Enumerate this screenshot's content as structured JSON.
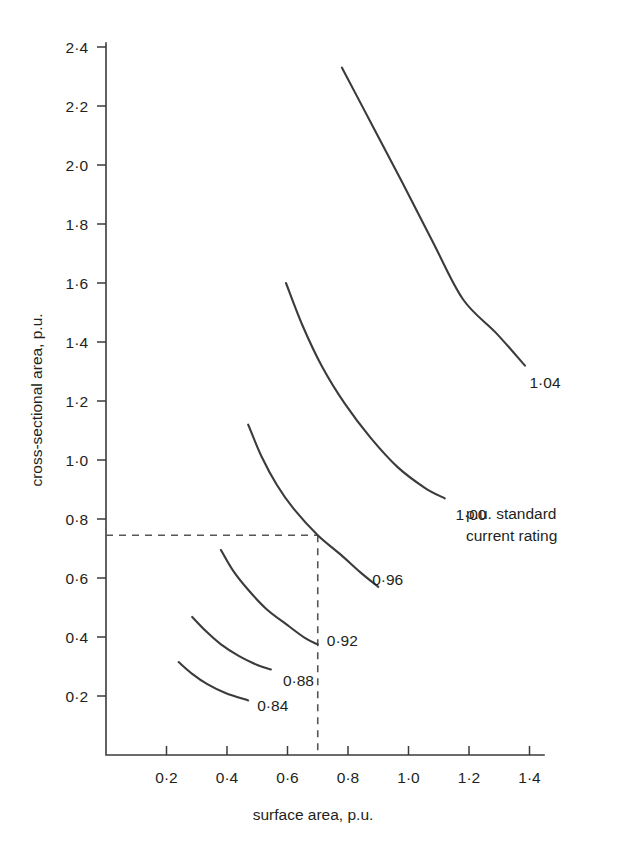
{
  "chart_data": {
    "type": "line",
    "title": "",
    "xlabel": "surface area, p.u.",
    "ylabel": "cross-sectional area, p.u.",
    "xlim": [
      0,
      1.48
    ],
    "ylim": [
      0,
      2.5
    ],
    "grid": false,
    "legend_position": "inline-curve-labels",
    "xticks": [
      "0·2",
      "0·4",
      "0·6",
      "0·8",
      "1·0",
      "1·2",
      "1·4"
    ],
    "xtick_values": [
      0.2,
      0.4,
      0.6,
      0.8,
      1.0,
      1.2,
      1.4
    ],
    "yticks": [
      "0·2",
      "0·4",
      "0·6",
      "0·8",
      "1·0",
      "1·2",
      "1·4",
      "1·6",
      "1·8",
      "2·0",
      "2·2",
      "2·4"
    ],
    "ytick_values": [
      0.2,
      0.4,
      0.6,
      0.8,
      1.0,
      1.2,
      1.4,
      1.6,
      1.8,
      2.0,
      2.2,
      2.4
    ],
    "annotation": {
      "line1": "p.u. standard",
      "line2": "current rating",
      "x": 1.19,
      "y": 0.8
    },
    "guides": {
      "note": "dashed construction lines meeting on the 0·96 curve",
      "x_value": 0.7,
      "y_value": 0.745
    },
    "series": [
      {
        "name": "1·04",
        "label": "1·04",
        "label_x": 1.4,
        "label_y": 1.245,
        "points": [
          [
            0.78,
            2.33
          ],
          [
            0.88,
            2.135
          ],
          [
            0.98,
            1.94
          ],
          [
            1.08,
            1.74
          ],
          [
            1.18,
            1.545
          ],
          [
            1.29,
            1.43
          ],
          [
            1.385,
            1.32
          ]
        ]
      },
      {
        "name": "1·00",
        "label": "1·00",
        "label_x": 1.155,
        "label_y": 0.795,
        "points": [
          [
            0.595,
            1.6
          ],
          [
            0.65,
            1.455
          ],
          [
            0.715,
            1.315
          ],
          [
            0.79,
            1.19
          ],
          [
            0.875,
            1.075
          ],
          [
            0.965,
            0.975
          ],
          [
            1.055,
            0.905
          ],
          [
            1.12,
            0.87
          ]
        ]
      },
      {
        "name": "0·96",
        "label": "0·96",
        "label_x": 0.88,
        "label_y": 0.575,
        "points": [
          [
            0.47,
            1.12
          ],
          [
            0.515,
            1.01
          ],
          [
            0.565,
            0.915
          ],
          [
            0.62,
            0.835
          ],
          [
            0.7,
            0.745
          ],
          [
            0.775,
            0.68
          ],
          [
            0.84,
            0.62
          ],
          [
            0.9,
            0.57
          ]
        ]
      },
      {
        "name": "0·92",
        "label": "0·92",
        "label_x": 0.73,
        "label_y": 0.37,
        "points": [
          [
            0.38,
            0.695
          ],
          [
            0.42,
            0.625
          ],
          [
            0.47,
            0.56
          ],
          [
            0.53,
            0.495
          ],
          [
            0.6,
            0.44
          ],
          [
            0.66,
            0.395
          ],
          [
            0.7,
            0.375
          ]
        ]
      },
      {
        "name": "0·88",
        "label": "0·88",
        "label_x": 0.585,
        "label_y": 0.235,
        "points": [
          [
            0.285,
            0.468
          ],
          [
            0.33,
            0.42
          ],
          [
            0.38,
            0.375
          ],
          [
            0.44,
            0.335
          ],
          [
            0.5,
            0.305
          ],
          [
            0.545,
            0.29
          ]
        ]
      },
      {
        "name": "0·84",
        "label": "0·84",
        "label_x": 0.5,
        "label_y": 0.15,
        "points": [
          [
            0.24,
            0.315
          ],
          [
            0.285,
            0.275
          ],
          [
            0.335,
            0.24
          ],
          [
            0.395,
            0.21
          ],
          [
            0.47,
            0.185
          ]
        ]
      }
    ]
  }
}
